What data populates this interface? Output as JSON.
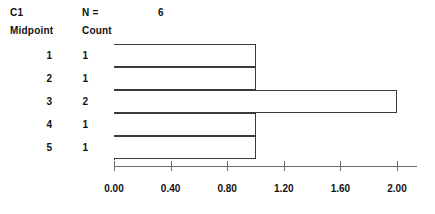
{
  "header": {
    "column_name": "C1",
    "n_label": "N =",
    "n_value": "6",
    "midpoint_header": "Midpoint",
    "count_header": "Count"
  },
  "chart_data": {
    "type": "bar",
    "orientation": "horizontal",
    "title": "",
    "subtitle": "",
    "xlabel": "",
    "ylabel": "",
    "categories": [
      "1",
      "2",
      "3",
      "4",
      "5"
    ],
    "values": [
      1,
      2,
      2,
      1,
      1
    ],
    "series": [
      {
        "name": "Count",
        "values": [
          1,
          1,
          2,
          1,
          1
        ]
      }
    ],
    "midpoints": [
      1,
      2,
      3,
      4,
      5
    ],
    "counts": [
      1,
      1,
      2,
      1,
      1
    ],
    "n": 6,
    "xlim": [
      0.0,
      2.0
    ],
    "xticks": [
      0.0,
      0.4,
      0.8,
      1.2,
      1.6,
      2.0
    ],
    "xtick_labels": [
      "0.00",
      "0.40",
      "0.80",
      "1.20",
      "1.60",
      "2.00"
    ],
    "grid": false,
    "legend": false,
    "bar_fill": "#ffffff",
    "bar_edge": "#3a3a3a",
    "axis_color": "#6d6d6d",
    "text_color": "#111111",
    "background": "#ffffff"
  },
  "rows": [
    {
      "midpoint": "1",
      "count": "1"
    },
    {
      "midpoint": "2",
      "count": "1"
    },
    {
      "midpoint": "3",
      "count": "2"
    },
    {
      "midpoint": "4",
      "count": "1"
    },
    {
      "midpoint": "5",
      "count": "1"
    }
  ],
  "axis": {
    "ticks": [
      {
        "label": "0.00",
        "value": 0.0
      },
      {
        "label": "0.40",
        "value": 0.4
      },
      {
        "label": "0.80",
        "value": 0.8
      },
      {
        "label": "1.20",
        "value": 1.2
      },
      {
        "label": "1.60",
        "value": 1.6
      },
      {
        "label": "2.00",
        "value": 2.0
      }
    ]
  }
}
